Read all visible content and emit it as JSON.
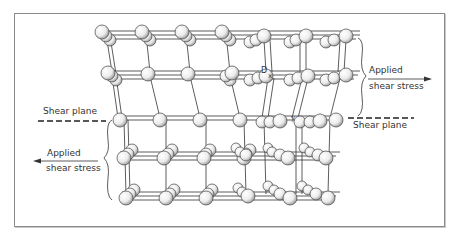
{
  "figure": {
    "labels": {
      "applied_right_line1": "Applied",
      "applied_right_line2": "shear stress",
      "applied_left_line1": "Applied",
      "applied_left_line2": "shear stress",
      "shear_plane_left": "Shear plane",
      "shear_plane_right": "Shear plane",
      "atom_label_d": "D",
      "atom_label_x": "x",
      "atom_label_y": "y"
    },
    "arrows": [
      {
        "name": "applied-shear-right-arrow",
        "direction": "right"
      },
      {
        "name": "applied-shear-left-arrow",
        "direction": "left"
      }
    ],
    "lattice": {
      "rows_upper": 2,
      "rows_lower": 3,
      "columns": 6,
      "depth_layers": 3
    },
    "colors": {
      "line": "#333333",
      "atom_fill": "#f2f2f2",
      "frame": "#8a8a8a"
    }
  }
}
